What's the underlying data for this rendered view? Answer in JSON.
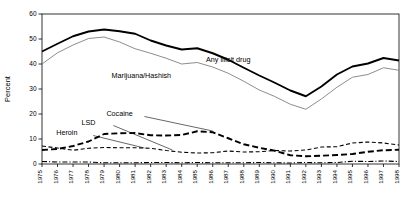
{
  "chart_data": {
    "type": "line",
    "title": "",
    "xlabel": "",
    "ylabel": "Percent",
    "ylim": [
      0,
      60
    ],
    "yticks": [
      0,
      10,
      20,
      30,
      40,
      50,
      60
    ],
    "grid": false,
    "legend_position": "inline-labels",
    "x": [
      1975,
      1976,
      1977,
      1978,
      1979,
      1980,
      1981,
      1982,
      1983,
      1984,
      1985,
      1986,
      1987,
      1988,
      1989,
      1990,
      1991,
      1992,
      1993,
      1994,
      1995,
      1996,
      1997,
      1998
    ],
    "series": [
      {
        "name": "Any illicit drug",
        "style": "solid-thick",
        "values": [
          45.0,
          48.1,
          51.1,
          53.0,
          53.8,
          53.1,
          52.1,
          49.4,
          47.4,
          45.8,
          46.3,
          44.3,
          41.7,
          38.5,
          35.4,
          32.5,
          29.4,
          27.1,
          31.0,
          35.8,
          39.0,
          40.2,
          42.4,
          41.4
        ]
      },
      {
        "name": "Marijuana/Hashish",
        "style": "solid-thin",
        "values": [
          40.0,
          44.5,
          47.6,
          50.2,
          50.8,
          48.8,
          46.1,
          44.3,
          42.3,
          40.0,
          40.6,
          38.8,
          36.3,
          33.1,
          29.6,
          27.0,
          23.9,
          21.9,
          26.0,
          30.7,
          34.7,
          35.8,
          38.5,
          37.5
        ]
      },
      {
        "name": "Cocaine",
        "style": "dashed-thick",
        "values": [
          5.6,
          6.0,
          7.2,
          9.0,
          12.0,
          12.3,
          12.4,
          11.5,
          11.4,
          11.6,
          13.1,
          12.7,
          10.3,
          7.9,
          6.5,
          5.3,
          3.5,
          3.1,
          3.3,
          3.6,
          4.0,
          4.9,
          5.5,
          5.7
        ]
      },
      {
        "name": "LSD",
        "style": "dashed-medium",
        "values": [
          7.2,
          6.4,
          5.5,
          6.3,
          6.6,
          6.5,
          6.5,
          6.3,
          5.4,
          4.7,
          4.4,
          4.5,
          5.2,
          4.8,
          4.9,
          5.4,
          5.2,
          5.6,
          6.8,
          6.9,
          8.4,
          8.8,
          8.4,
          7.6
        ]
      },
      {
        "name": "Heroin",
        "style": "dash-dot-thin",
        "values": [
          1.0,
          0.8,
          0.8,
          0.8,
          0.5,
          0.5,
          0.5,
          0.6,
          0.6,
          0.5,
          0.6,
          0.5,
          0.5,
          0.5,
          0.6,
          0.5,
          0.4,
          0.6,
          0.5,
          0.6,
          1.1,
          1.0,
          1.2,
          1.0
        ]
      }
    ],
    "annotations": [
      {
        "text": "Any illicit drug",
        "x": 1987.0,
        "y": 41.0
      },
      {
        "text": "Marijuana/Hashish",
        "x": 1981.4,
        "y": 34.5
      },
      {
        "text": "Cocaine",
        "x": 1980.0,
        "y": 19.2
      },
      {
        "text": "LSD",
        "x": 1978.0,
        "y": 15.6
      },
      {
        "text": "Heroin",
        "x": 1976.6,
        "y": 11.6
      }
    ],
    "colors": {
      "axis": "#000000",
      "any_illicit_drug": "#000000",
      "marijuana_hashish": "#808080",
      "cocaine": "#000000",
      "lsd": "#000000",
      "heroin": "#000000",
      "background": "#ffffff"
    }
  }
}
